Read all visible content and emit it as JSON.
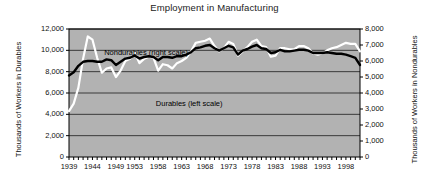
{
  "chart_data": {
    "type": "line",
    "title": "Employment in Manufacturing",
    "xlabel": "",
    "ylabel": "Thousands of Workers in Durables",
    "ylabel_right": "Thousands of Workers in Nondurables",
    "grid": true,
    "legend_position": "inline-annotation",
    "xlim": [
      1939,
      2001
    ],
    "ylim": [
      0,
      12000
    ],
    "ylim_right": [
      0,
      8000
    ],
    "ytick_labels_left": [
      "0",
      "2,000",
      "4,000",
      "6,000",
      "8,000",
      "10,000",
      "12,000"
    ],
    "ytick_values_left": [
      0,
      2000,
      4000,
      6000,
      8000,
      10000,
      12000
    ],
    "ytick_labels_right": [
      "0",
      "1,000",
      "2,000",
      "3,000",
      "4,000",
      "5,000",
      "6,000",
      "7,000",
      "8,000"
    ],
    "ytick_values_right": [
      0,
      1000,
      2000,
      3000,
      4000,
      5000,
      6000,
      7000,
      8000
    ],
    "xtick_labels": [
      "1939",
      "1944",
      "1949",
      "1953",
      "1958",
      "1963",
      "1968",
      "1973",
      "1978",
      "1983",
      "1988",
      "1993",
      "1998"
    ],
    "xtick_values": [
      1939,
      1944,
      1949,
      1953,
      1958,
      1963,
      1968,
      1973,
      1978,
      1983,
      1988,
      1993,
      1998
    ],
    "annotations": [
      {
        "text": "Nondurables (right scale)",
        "x": 1946.5,
        "y_px": 48
      },
      {
        "text": "Durables (left scale)",
        "x": 1957.5,
        "y_px": 99
      }
    ],
    "colors": {
      "plot_background": "#b2b2b2",
      "gridline": "#3a3a3a",
      "durables_line": "#ffffff",
      "nondurables_line": "#000000",
      "axis": "#000000",
      "text": "#111111"
    },
    "series": [
      {
        "name": "Durables (left scale)",
        "axis": "left",
        "color": "#ffffff",
        "x": [
          1939,
          1940,
          1941,
          1942,
          1943,
          1944,
          1945,
          1946,
          1947,
          1948,
          1949,
          1950,
          1951,
          1952,
          1953,
          1954,
          1955,
          1956,
          1957,
          1958,
          1959,
          1960,
          1961,
          1962,
          1963,
          1964,
          1965,
          1966,
          1967,
          1968,
          1969,
          1970,
          1971,
          1972,
          1973,
          1974,
          1975,
          1976,
          1977,
          1978,
          1979,
          1980,
          1981,
          1982,
          1983,
          1984,
          1985,
          1986,
          1987,
          1988,
          1989,
          1990,
          1991,
          1992,
          1993,
          1994,
          1995,
          1996,
          1997,
          1998,
          1999,
          2000,
          2001
        ],
        "values": [
          4300,
          5000,
          6500,
          9200,
          11300,
          11000,
          9300,
          7900,
          8300,
          8400,
          7500,
          8100,
          9000,
          9200,
          9800,
          8800,
          9200,
          9400,
          9300,
          8100,
          8700,
          8600,
          8300,
          8800,
          9000,
          9300,
          9900,
          10700,
          10800,
          10900,
          11100,
          10400,
          9900,
          10200,
          10800,
          10600,
          9500,
          9900,
          10300,
          10800,
          11000,
          10400,
          10300,
          9400,
          9500,
          10200,
          10200,
          10100,
          10100,
          10400,
          10400,
          10200,
          9700,
          9600,
          9700,
          10000,
          10200,
          10300,
          10500,
          10700,
          10600,
          10600,
          9900
        ]
      },
      {
        "name": "Nondurables (right scale)",
        "axis": "right",
        "color": "#000000",
        "x": [
          1939,
          1940,
          1941,
          1942,
          1943,
          1944,
          1945,
          1946,
          1947,
          1948,
          1949,
          1950,
          1951,
          1952,
          1953,
          1954,
          1955,
          1956,
          1957,
          1958,
          1959,
          1960,
          1961,
          1962,
          1963,
          1964,
          1965,
          1966,
          1967,
          1968,
          1969,
          1970,
          1971,
          1972,
          1973,
          1974,
          1975,
          1976,
          1977,
          1978,
          1979,
          1980,
          1981,
          1982,
          1983,
          1984,
          1985,
          1986,
          1987,
          1988,
          1989,
          1990,
          1991,
          1992,
          1993,
          1994,
          1995,
          1996,
          1997,
          1998,
          1999,
          2000,
          2001
        ],
        "values": [
          5100,
          5300,
          5700,
          5950,
          6000,
          6000,
          5950,
          5950,
          6100,
          6050,
          5750,
          5950,
          6150,
          6200,
          6350,
          6150,
          6250,
          6300,
          6250,
          6050,
          6250,
          6250,
          6200,
          6300,
          6300,
          6400,
          6550,
          6800,
          6850,
          6950,
          7000,
          6800,
          6650,
          6800,
          6950,
          6850,
          6400,
          6650,
          6750,
          6900,
          7000,
          6800,
          6750,
          6500,
          6550,
          6700,
          6600,
          6600,
          6650,
          6700,
          6700,
          6650,
          6500,
          6500,
          6500,
          6550,
          6500,
          6450,
          6450,
          6400,
          6300,
          6200,
          5750
        ]
      }
    ]
  }
}
